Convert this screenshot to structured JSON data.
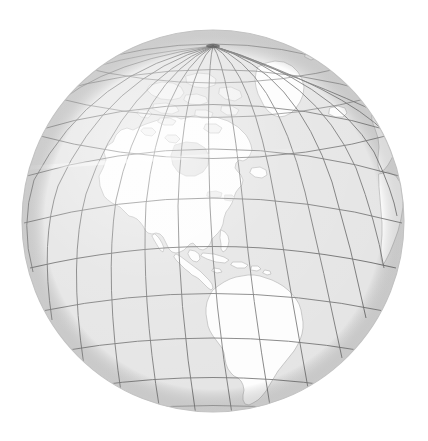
{
  "image": {
    "kind": "orthographic-globe-map",
    "title": "World globe, orthographic projection centred on the Americas",
    "width": 428,
    "height": 441,
    "background_color": "#ffffff"
  },
  "globe": {
    "center_x": 213,
    "center_y": 221,
    "radius": 191,
    "projection": "orthographic",
    "center_latitude": 22,
    "center_longitude": -65,
    "ocean_color": "#e4e4e4",
    "land_color": "#fdfdfd",
    "arctic_land_color": "#f1f1f1",
    "coastline_color": "#b9b9b9",
    "graticule_color": "#5e5e5e",
    "limb_color": "#c2c2c2",
    "highlight_color": "#f7f7f7",
    "pole_marker_color": "#3a3a3a",
    "graticule_interval_degrees": 15,
    "pole_visible": "north",
    "north_pole_screen_x": 213,
    "north_pole_screen_y": 46
  },
  "features": {
    "visible_landmasses": [
      "North America",
      "South America",
      "Greenland",
      "Canadian Arctic Archipelago",
      "Central America",
      "Caribbean Islands",
      "Iceland",
      "Western Europe",
      "Northwest Africa",
      "Svalbard"
    ],
    "graticule": {
      "meridian_step_degrees": 15,
      "parallel_step_degrees": 15,
      "equator_shown": true,
      "prime_meridian_shown": true
    }
  },
  "chart_data": {
    "type": "map",
    "title": "World globe, orthographic projection centred on the Americas",
    "projection": "orthographic",
    "grid": true,
    "legend": "none",
    "center": {
      "lat": 22,
      "lon": -65
    },
    "graticule_step_deg": 15,
    "lat_range": [
      -90,
      90
    ],
    "lon_range": [
      -180,
      180
    ]
  }
}
